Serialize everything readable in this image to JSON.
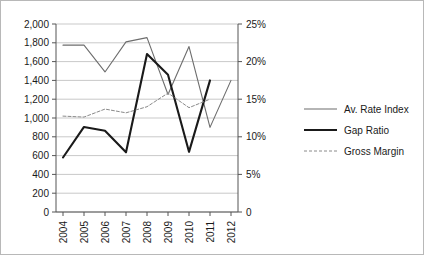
{
  "chart_data": {
    "type": "line",
    "title": "",
    "subtitle": "",
    "xlabel": "",
    "ylabel": "",
    "y2label": "",
    "categories": [
      "2004",
      "2005",
      "2006",
      "2007",
      "2008",
      "2009",
      "2010",
      "2011",
      "2012"
    ],
    "x_tick_labels": [
      "2004",
      "2005",
      "2006",
      "2007",
      "2008",
      "2009",
      "2010",
      "2011",
      "2012"
    ],
    "y_tick_labels": [
      "2,000",
      "1,800",
      "1,600",
      "1,400",
      "1,200",
      "1,000",
      "800",
      "600",
      "400",
      "200",
      "0"
    ],
    "y_tick_values": [
      2000,
      1800,
      1600,
      1400,
      1200,
      1000,
      800,
      600,
      400,
      200,
      0
    ],
    "y2_tick_labels": [
      "25%",
      "20%",
      "15%",
      "10%",
      "5%",
      "0"
    ],
    "y2_tick_values": [
      25,
      20,
      15,
      10,
      5,
      0
    ],
    "ylim": [
      0,
      2000
    ],
    "y2lim": [
      0,
      25
    ],
    "grid": true,
    "grid_axis": "y",
    "legend_position": "right",
    "series": [
      {
        "name": "Av. Rate Index",
        "style": "solid-thin",
        "color": "#6d6d6d",
        "axis": "left",
        "values": [
          1775,
          1775,
          1490,
          1810,
          1855,
          1250,
          1760,
          900,
          1400
        ]
      },
      {
        "name": "Gap Ratio",
        "style": "solid-thick",
        "color": "#1a1a1a",
        "axis": "left",
        "values": [
          580,
          905,
          865,
          635,
          1680,
          1460,
          640,
          1400,
          null
        ]
      },
      {
        "name": "Gross Margin",
        "style": "dashed-thin",
        "color": "#8a8a8a",
        "axis": "left",
        "values": [
          1020,
          1010,
          1095,
          1055,
          1120,
          1265,
          1110,
          1200,
          null
        ]
      }
    ],
    "annotations": []
  },
  "legend": {
    "items": [
      {
        "label": "Av. Rate Index",
        "swatch": "line-solid-thin-gray"
      },
      {
        "label": "Gap Ratio",
        "swatch": "line-solid-thick-black"
      },
      {
        "label": "Gross Margin",
        "swatch": "line-dashed-gray"
      }
    ]
  },
  "colors": {
    "av_rate_index": "#6d6d6d",
    "gap_ratio": "#1a1a1a",
    "gross_margin": "#8a8a8a",
    "gridline": "#c9c9c9",
    "axis": "#555555",
    "background": "#ffffff",
    "border": "#b8b8b8"
  }
}
